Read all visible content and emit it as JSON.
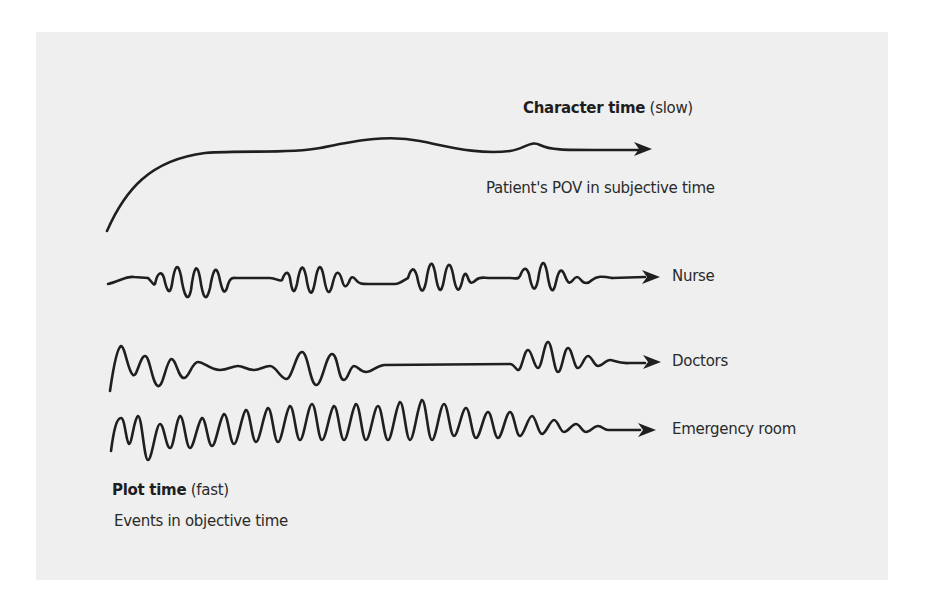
{
  "figure": {
    "character_time": {
      "title_bold": "Character time",
      "title_paren": "(slow)",
      "subtitle": "Patient's POV in subjective time"
    },
    "tracks": [
      {
        "id": "nurse",
        "label": "Nurse"
      },
      {
        "id": "doctors",
        "label": "Doctors"
      },
      {
        "id": "emergency",
        "label": "Emergency room"
      }
    ],
    "plot_time": {
      "title_bold": "Plot time",
      "title_paren": "(fast)",
      "subtitle": "Events in objective time"
    },
    "colors": {
      "panel_bg": "#efefef",
      "page_bg": "#ffffff",
      "ink": "#1f1f1f"
    }
  }
}
